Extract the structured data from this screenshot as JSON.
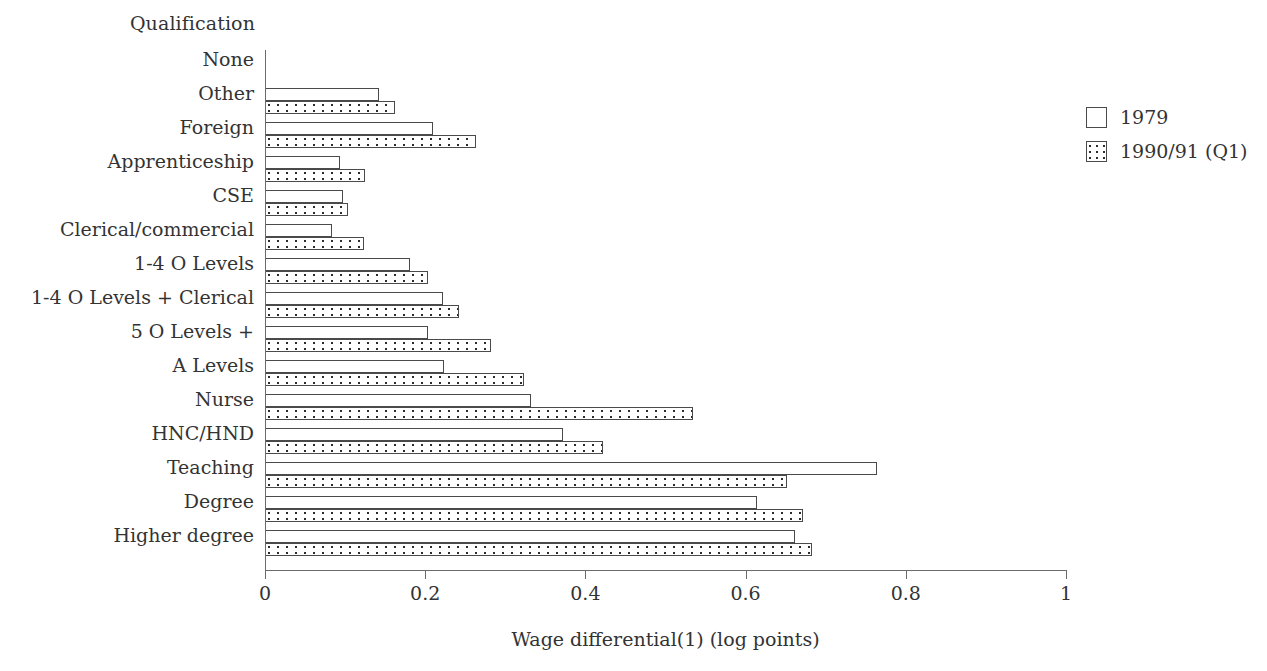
{
  "chart_data": {
    "type": "bar",
    "orientation": "horizontal",
    "title": "",
    "xlabel": "Wage differential(1) (log points)",
    "ylabel": "Qualification",
    "xlim": [
      0,
      1
    ],
    "xticks": [
      "0",
      "0.2",
      "0.4",
      "0.6",
      "0.8",
      "1"
    ],
    "xtick_values": [
      0,
      0.2,
      0.4,
      0.6,
      0.8,
      1
    ],
    "grid": false,
    "legend_position": "right",
    "categories": [
      "None",
      "Other",
      "Foreign",
      "Apprenticeship",
      "CSE",
      "Clerical/commercial",
      "1-4 O Levels",
      "1-4 O Levels + Clerical",
      "5 O Levels +",
      "A Levels",
      "Nurse",
      "HNC/HND",
      "Teaching",
      "Degree",
      "Higher degree"
    ],
    "series": [
      {
        "name": "1979",
        "pattern": "solid-white",
        "values": [
          0,
          0.142,
          0.21,
          0.094,
          0.097,
          0.084,
          0.181,
          0.222,
          0.203,
          0.224,
          0.332,
          0.372,
          0.764,
          0.614,
          0.662
        ]
      },
      {
        "name": "1990/91 (Q1)",
        "pattern": "dotted",
        "values": [
          0,
          0.162,
          0.263,
          0.125,
          0.104,
          0.124,
          0.203,
          0.242,
          0.282,
          0.323,
          0.534,
          0.422,
          0.652,
          0.672,
          0.683
        ]
      }
    ]
  },
  "legend": {
    "items": [
      {
        "label": "1979",
        "pattern": "solid"
      },
      {
        "label": "1990/91 (Q1)",
        "pattern": "dotted"
      }
    ]
  },
  "colors": {
    "axis": "#6b6b6b",
    "bar_outline": "#4a4a4a",
    "bar_fill_1979": "#ffffff",
    "bar_dot": "#2b2b2b",
    "text": "#333333",
    "background": "#ffffff"
  }
}
